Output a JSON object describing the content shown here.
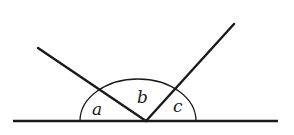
{
  "diagram": {
    "stroke_color": "#1a1a1a",
    "background": "#ffffff",
    "baseline": {
      "x1": 13,
      "y1": 121,
      "x2": 278,
      "y2": 121
    },
    "vertex": {
      "x": 146,
      "y": 121
    },
    "rays": [
      {
        "name": "left-ray",
        "x2": 38,
        "y2": 48
      },
      {
        "name": "right-ray",
        "x2": 234,
        "y2": 24
      }
    ],
    "arc": {
      "cx": 138,
      "cy": 121,
      "rx": 58,
      "ry": 42
    },
    "labels": [
      {
        "id": "a",
        "text": "a",
        "x": 92,
        "y": 115
      },
      {
        "id": "b",
        "text": "b",
        "x": 137,
        "y": 103
      },
      {
        "id": "c",
        "text": "c",
        "x": 173,
        "y": 112
      }
    ]
  }
}
